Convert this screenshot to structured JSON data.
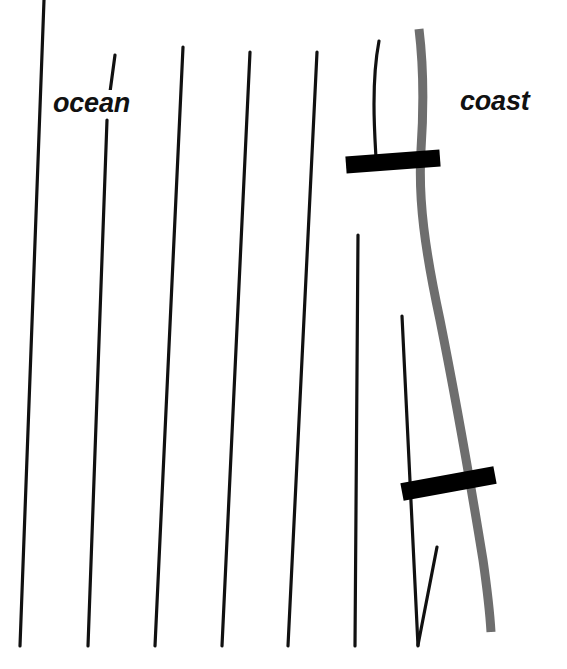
{
  "figure": {
    "type": "schematic-map",
    "title": "",
    "background_color": "#ffffff",
    "width": 567,
    "height": 669,
    "labels": {
      "ocean": "ocean",
      "coast": "coast"
    },
    "colors": {
      "contour_line": "#111111",
      "coastline": "#6e6e6e",
      "bar": "#000000",
      "background": "#ffffff",
      "label_text": "#111111"
    },
    "coastline": {
      "name": "coastline",
      "stroke_width": 9,
      "path": "M 419 29 C 424 70, 424 105, 421 150 C 418 200, 425 250, 440 320 C 455 395, 470 480, 483 560 C 488 595, 490 615, 491 632"
    },
    "contour_lines": [
      {
        "name": "contour-1",
        "x1": 44,
        "y1": 0,
        "x2": 20,
        "y2": 646
      },
      {
        "name": "contour-2-upper",
        "x1": 115,
        "y1": 55,
        "x2": 110,
        "y2": 92
      },
      {
        "name": "contour-2-lower",
        "x1": 107,
        "y1": 120,
        "x2": 88,
        "y2": 646
      },
      {
        "name": "contour-3",
        "x1": 183,
        "y1": 47,
        "x2": 155,
        "y2": 646
      },
      {
        "name": "contour-4",
        "x1": 250,
        "y1": 52,
        "x2": 222,
        "y2": 646
      },
      {
        "name": "contour-5",
        "x1": 317,
        "y1": 52,
        "x2": 288,
        "y2": 646
      },
      {
        "name": "contour-6",
        "x1": 358,
        "y1": 235,
        "x2": 355,
        "y2": 646
      },
      {
        "name": "contour-7",
        "x1": 402,
        "y1": 316,
        "x2": 418,
        "y2": 646
      },
      {
        "name": "contour-8",
        "x1": 437,
        "y1": 547,
        "x2": 418,
        "y2": 645
      }
    ],
    "curved_contour": {
      "name": "contour-7-top-curved",
      "path": "M 379 41 C 375 62, 374 82, 374 104 C 374 125, 375 140, 376 158"
    },
    "bars": [
      {
        "name": "bar-upper",
        "x1": 346,
        "y1": 165,
        "x2": 440,
        "y2": 158,
        "thickness": 17
      },
      {
        "name": "bar-lower",
        "x1": 402,
        "y1": 492,
        "x2": 495,
        "y2": 475,
        "thickness": 18
      }
    ]
  }
}
